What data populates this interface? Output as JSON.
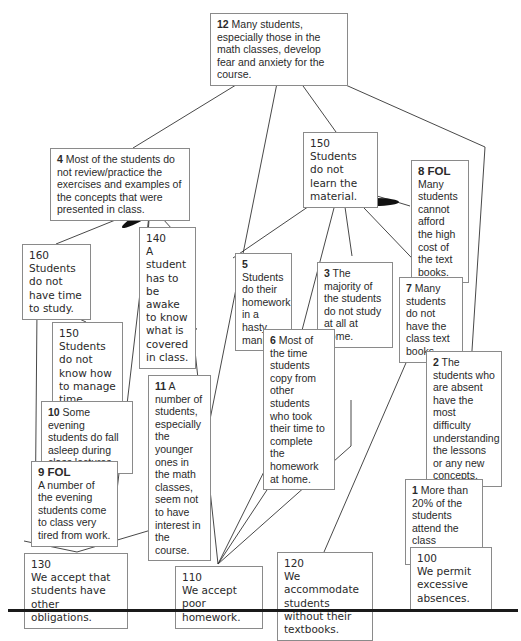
{
  "diagram": {
    "type": "current reality tree",
    "nodes": {
      "n12": {
        "num": "12",
        "text": "Many students, especially those in the math classes, develop fear and anxiety for the course."
      },
      "n4": {
        "num": "4",
        "text": "Most of the students do not review/practice the exercises and examples of the concepts that were presented in class."
      },
      "n150a": {
        "code": "150",
        "text": "Students do not learn the material."
      },
      "n8": {
        "num": "8 FOL",
        "text": "Many students cannot afford the high cost of the text books."
      },
      "n160": {
        "code": "160",
        "text": "Students do not have time to study."
      },
      "n140": {
        "code": "140",
        "text": "A student has to be awake to know what is covered in class."
      },
      "n5": {
        "num": "5",
        "text": "Students do their homework in a hasty manner."
      },
      "n3": {
        "num": "3",
        "text": "The majority of the students do not study at all at home."
      },
      "n7": {
        "num": "7",
        "text": "Many students do not have the class text books."
      },
      "n150b": {
        "code": "150",
        "text": "Students do not know how to manage time."
      },
      "n6": {
        "num": "6",
        "text": "Most of the time students copy from other students who took their time to complete the homework at home."
      },
      "n2": {
        "num": "2",
        "text": "The students who are absent have the most difficulty understanding the lessons or any new concepts."
      },
      "n10": {
        "num": "10",
        "text": "Some evening students do fall asleep during class lectures."
      },
      "n11": {
        "num": "11",
        "text": "A number of students, especially the younger ones in the math classes, seem not to have interest in the course."
      },
      "n9": {
        "num": "9 FOL",
        "text": "A number of the evening students come to class very tired from work."
      },
      "n1": {
        "num": "1",
        "text": "More than 20% of the students attend the class irregularly."
      },
      "n130": {
        "code": "130",
        "text": "We accept that students have other obligations."
      },
      "n110": {
        "code": "110",
        "text": "We accept poor homework."
      },
      "n120": {
        "code": "120",
        "text": "We accommodate students without their textbooks."
      },
      "n100": {
        "code": "100",
        "text": "We permit excessive absences."
      }
    },
    "edges": [
      {
        "from": "n4",
        "to": "n12"
      },
      {
        "from": "n11",
        "to": "n12"
      },
      {
        "from": "n150a",
        "to": "n12"
      },
      {
        "from": "n2",
        "to": "n12"
      },
      {
        "from": "n160",
        "to": "n4",
        "and_with": [
          "n140"
        ]
      },
      {
        "from": "n140",
        "to": "n4",
        "and_with": [
          "n160"
        ]
      },
      {
        "from": "n130",
        "to": "n4"
      },
      {
        "from": "n5",
        "to": "n150a"
      },
      {
        "from": "n6",
        "to": "n150a"
      },
      {
        "from": "n3",
        "to": "n150a"
      },
      {
        "from": "n7",
        "to": "n150a",
        "and_with": [
          "n8"
        ]
      },
      {
        "from": "n8",
        "to": "n150a",
        "and_with": [
          "n7"
        ]
      },
      {
        "from": "n150b",
        "to": "n160",
        "and_with": [
          "n130"
        ]
      },
      {
        "from": "n130",
        "to": "n160",
        "and_with": [
          "n150b"
        ]
      },
      {
        "from": "n9",
        "to": "n10"
      },
      {
        "from": "n130",
        "to": "n9"
      },
      {
        "from": "n130",
        "to": "n11"
      },
      {
        "from": "n110",
        "to": "n5"
      },
      {
        "from": "n110",
        "to": "n6"
      },
      {
        "from": "n110",
        "to": "n3"
      },
      {
        "from": "n110",
        "to": "n150a"
      },
      {
        "from": "n120",
        "to": "n7"
      },
      {
        "from": "n1",
        "to": "n2"
      },
      {
        "from": "n100",
        "to": "n1"
      }
    ],
    "colors": {
      "line": "#333333",
      "box_border": "#8a8a8a",
      "and_ellipse": "#111111",
      "rule": "#1a1a1a"
    }
  }
}
